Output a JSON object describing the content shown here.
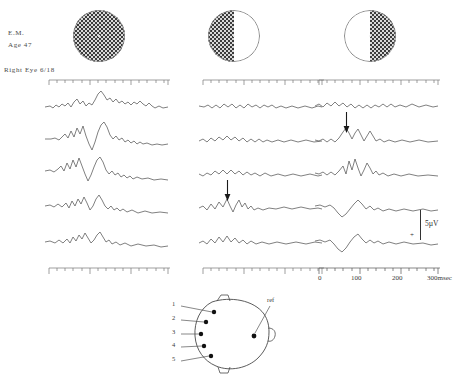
{
  "patient": {
    "name": "E.M.",
    "age": "Age  47",
    "eye": "Right Eye   6/18"
  },
  "stimuli": [
    {
      "name": "full-field-checkerboard",
      "pattern": "full"
    },
    {
      "name": "left-half-field-checkerboard",
      "pattern": "left"
    },
    {
      "name": "right-half-field-checkerboard",
      "pattern": "right"
    }
  ],
  "time_axis": {
    "labels": [
      "0",
      "100",
      "200",
      "300msec"
    ],
    "positions": [
      3,
      44,
      85,
      122
    ]
  },
  "calibration": {
    "amplitude": "5µV",
    "polarity": "+"
  },
  "head_diagram": {
    "electrode_labels": [
      "1",
      "2",
      "3",
      "4",
      "5"
    ],
    "reference_label": "ref"
  },
  "chart_data": {
    "type": "line",
    "xlabel": "msec",
    "ylabel": "5µV",
    "xlim": [
      0,
      330
    ],
    "grid": false,
    "columns": [
      {
        "stimulus": "full field",
        "channels": [
          "1",
          "2",
          "3",
          "4",
          "5"
        ],
        "marker": null,
        "traces": [
          "M3,21 L8,20 L11,22 L14,19 L17,21 L20,18 L23,20 L26,17 L29,21 L32,16 L35,13 L38,18 L41,15 L44,20 L47,17 L50,19 L53,14 L56,8 L59,5 L62,9 L65,14 L68,12 L71,16 L74,13 L77,17 L80,15 L83,18 L86,16 L89,19 L92,16 L95,18 L98,15 L101,18 L104,20 L107,17 L110,20 L113,22 L117,20 L121,22 L126,21",
          "M3,19 L9,19 L13,18 L17,20 L20,17 L23,14 L26,18 L29,11 L32,17 L35,8 L38,14 L41,6 L44,16 L47,24 L50,30 L53,22 L56,12 L59,5 L62,2 L65,7 L68,15 L71,19 L74,16 L77,20 L80,18 L83,22 L86,20 L89,23 L92,21 L95,24 L98,22 L101,24 L105,23 L110,25 L115,24 L120,25 L126,24",
          "M3,17 L8,16 L12,18 L16,15 L19,12 L22,17 L25,9 L28,15 L31,6 L34,13 L37,4 L40,12 L43,20 L46,27 L49,21 L52,13 L55,6 L58,3 L61,8 L64,16 L67,20 L70,17 L73,21 L76,19 L79,23 L82,21 L85,24 L88,22 L91,25 L95,23 L100,25 L106,24 L112,26 L119,25 L126,26",
          "M3,18 L8,17 L12,19 L16,16 L20,19 L24,15 L27,20 L30,13 L33,18 L36,11 L39,16 L42,9 L45,15 L48,22 L51,18 L54,11 L57,7 L60,12 L63,18 L66,21 L69,18 L72,22 L75,20 L78,23 L81,21 L85,24 L90,22 L96,25 L103,23 L110,25 L118,24 L126,25",
          "M3,20 L8,19 L13,21 L17,18 L21,21 L25,17 L28,21 L31,15 L34,19 L37,13 L40,17 L43,11 L46,16 L49,21 L52,18 L55,13 L58,10 L61,15 L64,20 L67,18 L70,22 L74,20 L78,23 L83,21 L89,24 L96,22 L104,24 L112,23 L119,25 L126,24"
        ]
      },
      {
        "stimulus": "left half field",
        "channels": [
          "1",
          "2",
          "3",
          "4",
          "5"
        ],
        "marker": {
          "channel_index": 3,
          "x": 32,
          "label": "peak"
        },
        "traces": [
          "M3,20 L8,21 L12,19 L16,22 L20,19 L24,22 L28,18 L32,21 L36,18 L40,22 L44,19 L48,22 L52,18 L56,21 L60,19 L64,22 L68,19 L72,21 L76,19 L80,22 L85,20 L90,22 L96,20 L102,22 L109,20 L116,22 L122,20 L126,21",
          "M3,21 L7,19 L11,22 L15,18 L19,21 L23,17 L27,20 L31,16 L35,20 L39,17 L43,21 L47,18 L51,22 L55,19 L59,22 L63,19 L67,22 L71,20 L76,22 L82,20 L88,22 L95,20 L102,22 L110,20 L118,22 L126,21",
          "M3,20 L7,22 L11,19 L15,21 L19,17 L23,20 L27,16 L31,20 L35,16 L39,20 L43,17 L47,21 L51,18 L55,21 L59,19 L64,22 L69,19 L75,22 L82,20 L89,22 L97,20 L105,22 L114,20 L122,22 L126,21",
          "M3,20 L7,18 L11,22 L15,16 L19,21 L23,14 L27,19 L31,11 L34,18 L37,24 L40,17 L43,12 L46,19 L49,15 L52,21 L55,18 L58,22 L62,20 L67,22 L73,20 L80,21 L88,19 L96,21 L105,19 L114,21 L122,20 L126,21",
          "M3,21 L7,19 L11,22 L15,17 L19,21 L23,15 L27,20 L31,14 L35,20 L39,16 L43,21 L47,18 L51,22 L55,19 L60,22 L66,20 L73,22 L81,20 L90,22 L100,20 L110,22 L119,20 L126,21"
        ]
      },
      {
        "stimulus": "right half field",
        "channels": [
          "1",
          "2",
          "3",
          "4",
          "5"
        ],
        "marker": {
          "channel_index": 1,
          "x": 40,
          "label": "peak"
        },
        "traces": [
          "M3,20 L7,18 L11,21 L15,17 L19,20 L23,16 L27,20 L31,17 L35,21 L39,18 L43,22 L47,19 L51,22 L55,19 L59,22 L63,19 L67,21 L71,18 L75,21 L79,18 L83,21 L88,19 L94,21 L100,18 L107,21 L114,19 L121,21 L126,20",
          "M3,20 L7,21 L11,19 L15,22 L19,19 L23,22 L27,18 L31,12 L34,8 L37,13 L40,19 L43,13 L46,9 L49,15 L52,21 L55,16 L58,11 L61,16 L64,21 L68,19 L72,22 L77,20 L83,22 L90,20 L98,22 L107,20 L116,22 L126,21",
          "M3,19 L7,20 L11,18 L15,21 L19,18 L23,21 L27,17 L31,12 L34,20 L37,7 L40,16 L43,5 L46,14 L49,22 L52,16 L55,9 L58,14 L61,20 L64,17 L67,21 L71,19 L76,22 L82,20 L89,22 L97,20 L106,22 L116,21 L126,22",
          "M3,18 L8,17 L13,19 L18,17 L22,20 L26,25 L30,29 L34,26 L38,21 L42,16 L46,12 L50,16 L54,21 L58,18 L62,22 L66,20 L71,23 L77,21 L84,23 L92,21 L101,23 L111,21 L119,23 L126,22",
          "M3,19 L8,18 L13,20 L18,18 L22,22 L26,27 L30,30 L34,26 L38,20 L42,15 L46,12 L50,17 L54,21 L58,18 L62,21 L66,19 L71,22 L77,20 L84,22 L92,20 L101,22 L111,21 L119,23 L126,22"
        ]
      }
    ]
  }
}
